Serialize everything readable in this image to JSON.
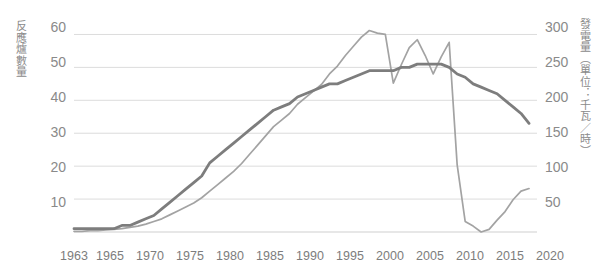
{
  "chart_data": {
    "type": "line",
    "title": "",
    "xlabel": "",
    "ylabel": "反應爐數量",
    "y2label": "發電量（單位：千瓦／時）",
    "grid": true,
    "legend": "none",
    "xlim": [
      1963,
      2021
    ],
    "ylim": [
      0,
      65
    ],
    "y2lim": [
      0,
      325
    ],
    "y_ticks": [
      10,
      20,
      30,
      40,
      50,
      60
    ],
    "y2_ticks": [
      50,
      100,
      150,
      200,
      250,
      300
    ],
    "x_ticks": [
      1963,
      1965,
      1970,
      1975,
      1980,
      1985,
      1990,
      1995,
      2000,
      2005,
      2010,
      2015,
      2020
    ],
    "x": [
      1963,
      1964,
      1965,
      1966,
      1967,
      1968,
      1969,
      1970,
      1971,
      1972,
      1973,
      1974,
      1975,
      1976,
      1977,
      1978,
      1979,
      1980,
      1981,
      1982,
      1983,
      1984,
      1985,
      1986,
      1987,
      1988,
      1989,
      1990,
      1991,
      1992,
      1993,
      1994,
      1995,
      1996,
      1997,
      1998,
      1999,
      2000,
      2001,
      2002,
      2003,
      2004,
      2005,
      2006,
      2007,
      2008,
      2009,
      2010,
      2011,
      2012,
      2013,
      2014,
      2015,
      2016,
      2017,
      2018,
      2019,
      2020
    ],
    "series": [
      {
        "name": "反應爐數量",
        "axis": "left",
        "unit": "座",
        "values": [
          1,
          1,
          1,
          1,
          1,
          1,
          2,
          2,
          3,
          4,
          5,
          7,
          9,
          11,
          13,
          15,
          17,
          21,
          23,
          25,
          27,
          29,
          31,
          33,
          35,
          37,
          38,
          39,
          41,
          42,
          43,
          44,
          45,
          45,
          46,
          47,
          48,
          49,
          49,
          49,
          49,
          50,
          50,
          51,
          51,
          51,
          51,
          50,
          48,
          47,
          45,
          44,
          43,
          42,
          40,
          38,
          36,
          33
        ]
      },
      {
        "name": "發電量",
        "axis": "right",
        "unit": "千瓦／時",
        "values": [
          1,
          1,
          2,
          2,
          3,
          4,
          5,
          7,
          9,
          12,
          16,
          20,
          26,
          32,
          38,
          44,
          52,
          62,
          72,
          82,
          92,
          104,
          118,
          132,
          146,
          160,
          170,
          180,
          194,
          204,
          214,
          224,
          240,
          252,
          268,
          282,
          296,
          306,
          302,
          300,
          226,
          254,
          280,
          292,
          268,
          240,
          266,
          288,
          102,
          16,
          9,
          0,
          4,
          18,
          31,
          49,
          62,
          66
        ]
      }
    ],
    "annotations": {
      "collapse_year": 2011,
      "collapse_note": "2011 急遽下降"
    }
  },
  "axes": {
    "left": {
      "title": "反應爐數量",
      "ticks": [
        "60",
        "50",
        "40",
        "30",
        "20",
        "10"
      ]
    },
    "right": {
      "title": "發電量（單位：千瓦／時）",
      "ticks": [
        "300",
        "250",
        "200",
        "150",
        "100",
        "50"
      ]
    },
    "bottom": {
      "ticks": [
        "1963",
        "1965",
        "1970",
        "1975",
        "1980",
        "1985",
        "1990",
        "1995",
        "2000",
        "2005",
        "2010",
        "2015",
        "2020"
      ]
    }
  },
  "colors": {
    "background": "#ffffff",
    "grid": "#dcdcdc",
    "baseline": "#cfcfcf",
    "text": "#8a8a8a",
    "series_generation": "#a3a3a3",
    "series_reactors": "#7d7d7d"
  }
}
